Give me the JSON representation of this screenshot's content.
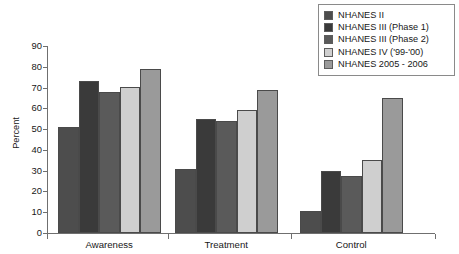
{
  "chart_data": {
    "type": "bar",
    "title": "",
    "xlabel": "",
    "ylabel": "Percent",
    "ylim": [
      0,
      90
    ],
    "yticks": [
      0,
      10,
      20,
      30,
      40,
      50,
      60,
      70,
      80,
      90
    ],
    "grid": false,
    "legend_position": "top-right",
    "categories": [
      "Awareness",
      "Treatment",
      "Control"
    ],
    "series": [
      {
        "name": "NHANES II",
        "color": "#4d4d4d",
        "values": [
          51,
          31,
          10.5
        ]
      },
      {
        "name": "NHANES III (Phase 1)",
        "color": "#3a3a3a",
        "values": [
          73,
          55,
          30
        ]
      },
      {
        "name": "NHANES III (Phase 2)",
        "color": "#5a5a5a",
        "values": [
          68,
          54,
          27.5
        ]
      },
      {
        "name": "NHANES IV ('99-'00)",
        "color": "#cfcfcf",
        "values": [
          70.5,
          59,
          35
        ]
      },
      {
        "name": "NHANES 2005 - 2006",
        "color": "#9a9a9a",
        "values": [
          79,
          69,
          65
        ]
      }
    ]
  },
  "legend": {
    "items": [
      {
        "label": "NHANES II"
      },
      {
        "label": "NHANES III (Phase 1)"
      },
      {
        "label": "NHANES III (Phase 2)"
      },
      {
        "label": "NHANES IV ('99-'00)"
      },
      {
        "label": "NHANES 2005 - 2006"
      }
    ]
  },
  "axes": {
    "y_title": "Percent",
    "y_labels": [
      "90",
      "80",
      "70",
      "60",
      "50",
      "40",
      "30",
      "20",
      "10",
      "0"
    ],
    "x_labels": [
      "Awareness",
      "Treatment",
      "Control"
    ]
  }
}
